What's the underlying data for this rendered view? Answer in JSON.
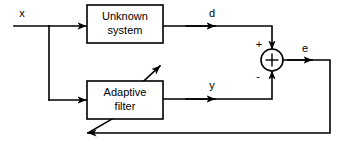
{
  "diagram": {
    "type": "block-diagram",
    "blocks": [
      {
        "id": "unknown-system",
        "label_line1": "Unknown",
        "label_line2": "system",
        "x": 87,
        "y": 5,
        "w": 76,
        "h": 38
      },
      {
        "id": "adaptive-filter",
        "label_line1": "Adaptive",
        "label_line2": "filter",
        "x": 87,
        "y": 81,
        "w": 76,
        "h": 38
      }
    ],
    "summing_junction": {
      "id": "summing-junction",
      "symbol": "+",
      "cx": 272,
      "cy": 60,
      "r": 11,
      "plus_sign": "+",
      "minus_sign": "-",
      "plus_x": 259,
      "plus_y": 45,
      "minus_x": 258,
      "minus_y": 77
    },
    "signals": [
      {
        "id": "input-x",
        "label": "x",
        "x": 22,
        "y": 14
      },
      {
        "id": "desired-d",
        "label": "d",
        "x": 212,
        "y": 14
      },
      {
        "id": "output-y",
        "label": "y",
        "x": 212,
        "y": 86
      },
      {
        "id": "error-e",
        "label": "e",
        "x": 305,
        "y": 49
      }
    ],
    "colors": {
      "line": "#000000",
      "background": "#ffffff",
      "text": "#000000"
    }
  }
}
